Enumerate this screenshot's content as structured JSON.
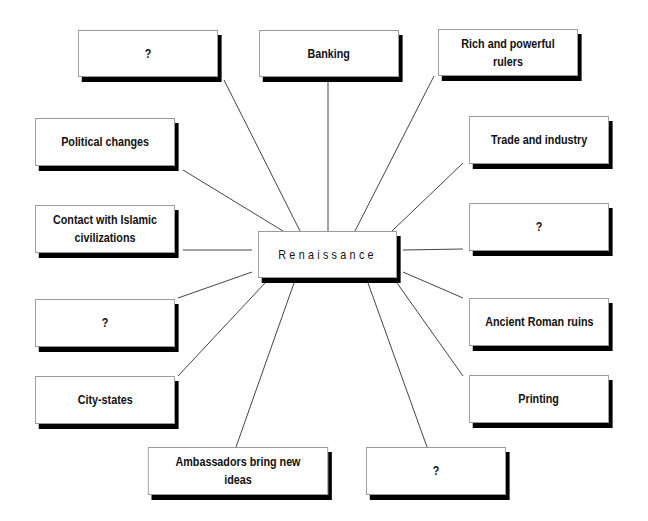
{
  "diagram": {
    "center": {
      "label": "Renaissance"
    },
    "nodes": [
      {
        "label": "?"
      },
      {
        "label": "Banking"
      },
      {
        "label": "Rich and powerful rulers"
      },
      {
        "label": "Political changes"
      },
      {
        "label": "Trade and industry"
      },
      {
        "label": "Contact with Islamic civilizations"
      },
      {
        "label": "?"
      },
      {
        "label": "?"
      },
      {
        "label": "Ancient Roman ruins"
      },
      {
        "label": "City-states"
      },
      {
        "label": "Printing"
      },
      {
        "label": "Ambassadors bring new ideas"
      },
      {
        "label": "?"
      }
    ]
  }
}
